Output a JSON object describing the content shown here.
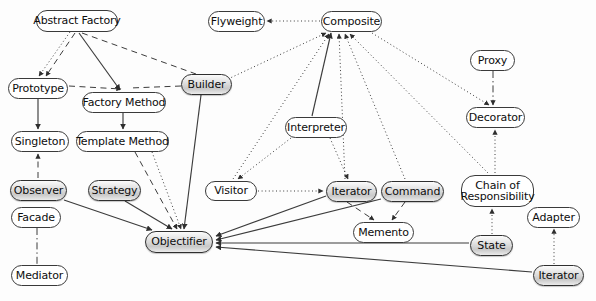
{
  "diagram": {
    "kind": "directed-graph",
    "background": "#fdfdfd",
    "node_fill_plain": "#ffffff",
    "node_fill_shaded": "#c9c9c9",
    "node_stroke": "#3a3a3a",
    "edge_color": "#3c3c3c",
    "nodes": [
      {
        "id": "abstract_factory",
        "label": "Abstract Factory",
        "x": 36,
        "y": 10,
        "w": 82,
        "h": 22,
        "shaded": false
      },
      {
        "id": "flyweight",
        "label": "Flyweight",
        "x": 208,
        "y": 11,
        "w": 57,
        "h": 21,
        "shaded": false
      },
      {
        "id": "composite",
        "label": "Composite",
        "x": 321,
        "y": 11,
        "w": 61,
        "h": 21,
        "shaded": false
      },
      {
        "id": "proxy",
        "label": "Proxy",
        "x": 470,
        "y": 50,
        "w": 45,
        "h": 21,
        "shaded": false
      },
      {
        "id": "prototype",
        "label": "Prototype",
        "x": 8,
        "y": 78,
        "w": 60,
        "h": 21,
        "shaded": false
      },
      {
        "id": "builder",
        "label": "Builder",
        "x": 181,
        "y": 74,
        "w": 51,
        "h": 21,
        "shaded": true
      },
      {
        "id": "factory_method",
        "label": "Factory Method",
        "x": 82,
        "y": 92,
        "w": 84,
        "h": 21,
        "shaded": false
      },
      {
        "id": "decorator",
        "label": "Decorator",
        "x": 466,
        "y": 107,
        "w": 59,
        "h": 21,
        "shaded": false
      },
      {
        "id": "interpreter",
        "label": "Interpreter",
        "x": 285,
        "y": 117,
        "w": 62,
        "h": 21,
        "shaded": false
      },
      {
        "id": "singleton",
        "label": "Singleton",
        "x": 11,
        "y": 131,
        "w": 58,
        "h": 21,
        "shaded": false
      },
      {
        "id": "template_method",
        "label": "Template Method",
        "x": 76,
        "y": 131,
        "w": 93,
        "h": 21,
        "shaded": false
      },
      {
        "id": "observer",
        "label": "Observer",
        "x": 10,
        "y": 180,
        "w": 57,
        "h": 21,
        "shaded": true
      },
      {
        "id": "strategy",
        "label": "Strategy",
        "x": 88,
        "y": 180,
        "w": 53,
        "h": 21,
        "shaded": true
      },
      {
        "id": "visitor",
        "label": "Visitor",
        "x": 205,
        "y": 181,
        "w": 52,
        "h": 20,
        "shaded": false
      },
      {
        "id": "iterator",
        "label": "Iterator",
        "x": 326,
        "y": 181,
        "w": 51,
        "h": 21,
        "shaded": true
      },
      {
        "id": "command",
        "label": "Command",
        "x": 381,
        "y": 181,
        "w": 63,
        "h": 21,
        "shaded": true
      },
      {
        "id": "chain_of_responsibility",
        "label": "Chain of Responsibility",
        "x": 461,
        "y": 175,
        "w": 73,
        "h": 32,
        "shaded": false,
        "two_line": true
      },
      {
        "id": "facade",
        "label": "Facade",
        "x": 11,
        "y": 207,
        "w": 50,
        "h": 21,
        "shaded": false
      },
      {
        "id": "adapter",
        "label": "Adapter",
        "x": 527,
        "y": 207,
        "w": 53,
        "h": 21,
        "shaded": false
      },
      {
        "id": "memento",
        "label": "Memento",
        "x": 353,
        "y": 222,
        "w": 61,
        "h": 21,
        "shaded": false
      },
      {
        "id": "objectifier",
        "label": "Objectifier",
        "x": 145,
        "y": 231,
        "w": 68,
        "h": 22,
        "shaded": true
      },
      {
        "id": "state",
        "label": "State",
        "x": 470,
        "y": 235,
        "w": 43,
        "h": 21,
        "shaded": true
      },
      {
        "id": "mediator",
        "label": "Mediator",
        "x": 11,
        "y": 265,
        "w": 57,
        "h": 21,
        "shaded": false
      },
      {
        "id": "iterator2",
        "label": "Iterator",
        "x": 533,
        "y": 265,
        "w": 51,
        "h": 21,
        "shaded": true
      }
    ],
    "edges": [
      {
        "from": "abstract_factory",
        "to": "prototype",
        "style": "dotted",
        "arrow": true,
        "x1": 70,
        "y1": 32,
        "x2": 39,
        "y2": 76
      },
      {
        "from": "abstract_factory",
        "to": "prototype",
        "style": "dashed",
        "arrow": true,
        "x1": 75,
        "y1": 33,
        "x2": 46,
        "y2": 76
      },
      {
        "from": "abstract_factory",
        "to": "factory_method",
        "style": "solid",
        "arrow": true,
        "x1": 79,
        "y1": 33,
        "x2": 120,
        "y2": 90
      },
      {
        "from": "abstract_factory",
        "to": "builder",
        "style": "dashed",
        "arrow": false,
        "x1": 82,
        "y1": 33,
        "x2": 196,
        "y2": 74
      },
      {
        "from": "prototype",
        "to": "factory_method",
        "style": "dashed",
        "arrow": true,
        "x1": 69,
        "y1": 86,
        "x2": 121,
        "y2": 89
      },
      {
        "from": "builder",
        "to": "factory_method",
        "style": "dashed",
        "arrow": false,
        "x1": 181,
        "y1": 86,
        "x2": 130,
        "y2": 88
      },
      {
        "from": "prototype",
        "to": "singleton",
        "style": "solid",
        "arrow": true,
        "x1": 38,
        "y1": 99,
        "x2": 38,
        "y2": 129
      },
      {
        "from": "factory_method",
        "to": "template_method",
        "style": "solid",
        "arrow": true,
        "x1": 123,
        "y1": 113,
        "x2": 123,
        "y2": 129
      },
      {
        "from": "singleton",
        "to": "observer",
        "style": "dashed",
        "arrow": true,
        "x1": 38,
        "y1": 178,
        "x2": 38,
        "y2": 154
      },
      {
        "from": "builder",
        "to": "objectifier",
        "style": "solid",
        "arrow": true,
        "x1": 201,
        "y1": 95,
        "x2": 184,
        "y2": 229
      },
      {
        "from": "template_method",
        "to": "objectifier",
        "style": "dashed",
        "arrow": true,
        "x1": 135,
        "y1": 152,
        "x2": 177,
        "y2": 229
      },
      {
        "from": "template_method",
        "to": "objectifier",
        "style": "dotted",
        "arrow": true,
        "x1": 152,
        "y1": 152,
        "x2": 181,
        "y2": 229
      },
      {
        "from": "observer",
        "to": "objectifier",
        "style": "solid",
        "arrow": true,
        "x1": 64,
        "y1": 200,
        "x2": 152,
        "y2": 230
      },
      {
        "from": "strategy",
        "to": "objectifier",
        "style": "solid",
        "arrow": true,
        "x1": 125,
        "y1": 201,
        "x2": 172,
        "y2": 229
      },
      {
        "from": "facade",
        "to": "mediator",
        "style": "dashdot",
        "arrow": false,
        "x1": 37,
        "y1": 228,
        "x2": 37,
        "y2": 264
      },
      {
        "from": "composite",
        "to": "flyweight",
        "style": "dotted",
        "arrow": true,
        "x1": 320,
        "y1": 21,
        "x2": 267,
        "y2": 21
      },
      {
        "from": "abstract_factory",
        "to": "composite",
        "style": "dotted",
        "arrow": true,
        "x1": 228,
        "y1": 79,
        "x2": 326,
        "y2": 33
      },
      {
        "from": "interpreter",
        "to": "composite",
        "style": "solid",
        "arrow": true,
        "x1": 312,
        "y1": 116,
        "x2": 331,
        "y2": 33
      },
      {
        "from": "visitor",
        "to": "composite",
        "style": "dotted",
        "arrow": true,
        "x1": 233,
        "y1": 179,
        "x2": 329,
        "y2": 34
      },
      {
        "from": "iterator",
        "to": "composite",
        "style": "dotted",
        "arrow": true,
        "x1": 345,
        "y1": 179,
        "x2": 339,
        "y2": 34
      },
      {
        "from": "command",
        "to": "composite",
        "style": "dotted",
        "arrow": true,
        "x1": 405,
        "y1": 179,
        "x2": 345,
        "y2": 34
      },
      {
        "from": "chain_of_responsibility",
        "to": "composite",
        "style": "dotted",
        "arrow": true,
        "x1": 488,
        "y1": 173,
        "x2": 350,
        "y2": 34
      },
      {
        "from": "composite",
        "to": "decorator",
        "style": "dotted",
        "arrow": true,
        "x1": 372,
        "y1": 33,
        "x2": 489,
        "y2": 105
      },
      {
        "from": "proxy",
        "to": "decorator",
        "style": "dashdot",
        "arrow": true,
        "x1": 493,
        "y1": 71,
        "x2": 493,
        "y2": 105
      },
      {
        "from": "chain_of_responsibility",
        "to": "decorator",
        "style": "dotted",
        "arrow": true,
        "x1": 495,
        "y1": 173,
        "x2": 495,
        "y2": 130
      },
      {
        "from": "interpreter",
        "to": "visitor",
        "style": "dotted",
        "arrow": true,
        "x1": 291,
        "y1": 138,
        "x2": 238,
        "y2": 179
      },
      {
        "from": "interpreter",
        "to": "iterator",
        "style": "dotted",
        "arrow": true,
        "x1": 330,
        "y1": 138,
        "x2": 348,
        "y2": 179
      },
      {
        "from": "visitor",
        "to": "iterator",
        "style": "dotted",
        "arrow": true,
        "x1": 258,
        "y1": 191,
        "x2": 323,
        "y2": 191
      },
      {
        "from": "iterator",
        "to": "memento",
        "style": "dashed",
        "arrow": true,
        "x1": 347,
        "y1": 202,
        "x2": 374,
        "y2": 220
      },
      {
        "from": "command",
        "to": "memento",
        "style": "dashed",
        "arrow": true,
        "x1": 405,
        "y1": 202,
        "x2": 392,
        "y2": 220
      },
      {
        "from": "iterator",
        "to": "objectifier",
        "style": "solid",
        "arrow": true,
        "x1": 326,
        "y1": 196,
        "x2": 216,
        "y2": 236
      },
      {
        "from": "command",
        "to": "objectifier",
        "style": "solid",
        "arrow": true,
        "x1": 381,
        "y1": 199,
        "x2": 216,
        "y2": 240
      },
      {
        "from": "state",
        "to": "chain_of_responsibility",
        "style": "dotted",
        "arrow": true,
        "x1": 492,
        "y1": 234,
        "x2": 492,
        "y2": 209
      },
      {
        "from": "iterator2",
        "to": "adapter",
        "style": "dotted",
        "arrow": true,
        "x1": 554,
        "y1": 264,
        "x2": 554,
        "y2": 229
      },
      {
        "from": "state",
        "to": "objectifier",
        "style": "solid",
        "arrow": true,
        "x1": 469,
        "y1": 243,
        "x2": 216,
        "y2": 243
      },
      {
        "from": "iterator2",
        "to": "objectifier",
        "style": "solid",
        "arrow": true,
        "x1": 532,
        "y1": 272,
        "x2": 216,
        "y2": 247
      }
    ]
  }
}
